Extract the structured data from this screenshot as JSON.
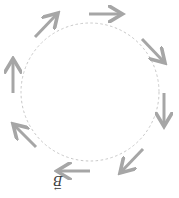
{
  "diagram": {
    "colors": {
      "arrow": "#a6a6a6",
      "circle": "#c8c8c8",
      "label": "#3a3a3a",
      "background": "#ffffff"
    },
    "circle": {
      "cx": 90,
      "cy": 92,
      "r": 69,
      "style": "dashed"
    },
    "direction": "clockwise",
    "arrows": [
      {
        "id": "top",
        "x1": 89,
        "y1": 14,
        "x2": 121,
        "y2": 14
      },
      {
        "id": "top-right",
        "x1": 142,
        "y1": 39,
        "x2": 164,
        "y2": 62
      },
      {
        "id": "right",
        "x1": 164,
        "y1": 93,
        "x2": 164,
        "y2": 125
      },
      {
        "id": "bottom-right",
        "x1": 143,
        "y1": 149,
        "x2": 121,
        "y2": 172
      },
      {
        "id": "bottom",
        "x1": 90,
        "y1": 171,
        "x2": 58,
        "y2": 171
      },
      {
        "id": "bottom-left",
        "x1": 36,
        "y1": 147,
        "x2": 14,
        "y2": 125
      },
      {
        "id": "left",
        "x1": 13,
        "y1": 93,
        "x2": 13,
        "y2": 60
      },
      {
        "id": "top-left",
        "x1": 35,
        "y1": 37,
        "x2": 57,
        "y2": 14
      }
    ],
    "label": {
      "text": "B",
      "vector_mark": "→",
      "orientation": "upside-down",
      "x": 55,
      "y": 176
    }
  }
}
